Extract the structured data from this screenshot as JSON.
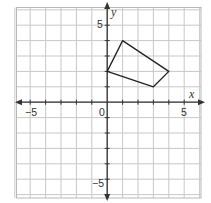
{
  "chart_data": {
    "type": "scatter",
    "title": "",
    "xlabel": "x",
    "ylabel": "y",
    "xlim": [
      -6,
      6
    ],
    "ylim": [
      -6,
      6
    ],
    "grid": true,
    "tick_labels": {
      "x": [
        "-5",
        "0",
        "5"
      ],
      "y": [
        "5",
        "-5"
      ]
    },
    "series": [
      {
        "name": "quadrilateral",
        "shape": "polygon",
        "points": [
          [
            0,
            2
          ],
          [
            1,
            4
          ],
          [
            4,
            2
          ],
          [
            3,
            1
          ]
        ]
      }
    ]
  },
  "labels": {
    "x_axis": "x",
    "y_axis": "y",
    "origin": "0",
    "x_neg5": "−5",
    "x_pos5": "5",
    "y_pos5": "5",
    "y_neg5": "−5"
  },
  "colors": {
    "grid": "#c8c8c8",
    "border": "#b0b0b0",
    "axis": "#333333",
    "polygon": "#222222"
  }
}
